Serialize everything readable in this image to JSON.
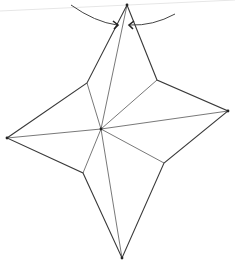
{
  "diagram": {
    "title": "",
    "type": "origami-star-fold-diagram",
    "colors": {
      "line": "#3a3a3a",
      "crease": "#555555",
      "guide": "#e6e6e6",
      "background": "#ffffff"
    },
    "vertices": {
      "top": [
        127,
        5
      ],
      "upper_right_inner": [
        157,
        80
      ],
      "right": [
        228,
        111
      ],
      "lower_right_inner": [
        164,
        163
      ],
      "bottom": [
        122,
        258
      ],
      "lower_left_inner": [
        83,
        173
      ],
      "left": [
        7,
        138
      ],
      "upper_left_inner": [
        87,
        83
      ],
      "center": [
        101,
        129
      ]
    },
    "outline": [
      "top",
      "upper_right_inner",
      "right",
      "lower_right_inner",
      "bottom",
      "lower_left_inner",
      "left",
      "upper_left_inner"
    ],
    "creases": [
      [
        "center",
        "top"
      ],
      [
        "center",
        "upper_left_inner"
      ],
      [
        "center",
        "upper_right_inner"
      ],
      [
        "center",
        "right"
      ],
      [
        "center",
        "lower_right_inner"
      ],
      [
        "center",
        "bottom"
      ],
      [
        "center",
        "lower_left_inner"
      ],
      [
        "center",
        "left"
      ]
    ],
    "guide_line": [
      [
        0,
        11
      ],
      [
        235,
        0
      ]
    ],
    "fold_arrows": [
      {
        "name": "left-fold-arrow",
        "arc": "M71 5 Q95 22 117 25",
        "head": "M113 21 L118 25 L114 29"
      },
      {
        "name": "right-fold-arrow",
        "arc": "M175 14 Q153 26 130 25",
        "head": "M134 21 L129 25 L133 29"
      }
    ],
    "marked_vertices": [
      "top",
      "right",
      "left",
      "bottom",
      "center"
    ]
  }
}
